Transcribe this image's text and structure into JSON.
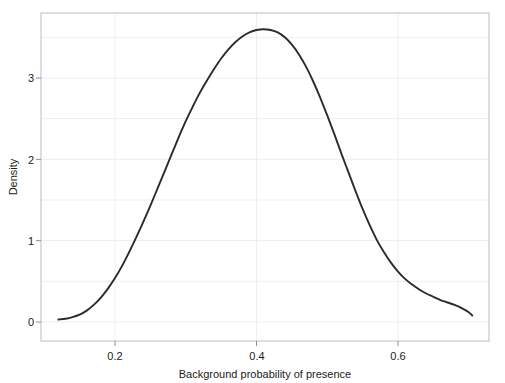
{
  "chart_data": {
    "type": "line",
    "title": "",
    "subtitle": "",
    "xlabel": "Background probability of presence",
    "ylabel": "Density",
    "xlim": [
      0.105,
      0.755
    ],
    "ylim": [
      -0.07,
      3.75
    ],
    "grid": true,
    "grid_color": "#eceef1",
    "legend": null,
    "legend_position": "none",
    "line_color": "#2b2b2b",
    "line_width": 1.9,
    "background": "#ffffff",
    "frame_color": "#b9bcc0",
    "xticks": [
      0.2,
      0.4,
      0.6
    ],
    "xtick_labels": [
      "0.2",
      "0.4",
      "0.6"
    ],
    "yticks": [
      0,
      1,
      2,
      3
    ],
    "ytick_labels": [
      "0",
      "1",
      "2",
      "3"
    ],
    "series": [
      {
        "name": "Density",
        "x": [
          0.12,
          0.13,
          0.14,
          0.15,
          0.16,
          0.17,
          0.18,
          0.19,
          0.2,
          0.21,
          0.22,
          0.23,
          0.24,
          0.25,
          0.26,
          0.27,
          0.28,
          0.29,
          0.3,
          0.31,
          0.32,
          0.33,
          0.34,
          0.35,
          0.36,
          0.37,
          0.38,
          0.39,
          0.4,
          0.41,
          0.42,
          0.43,
          0.44,
          0.45,
          0.46,
          0.47,
          0.48,
          0.49,
          0.5,
          0.51,
          0.52,
          0.53,
          0.54,
          0.55,
          0.56,
          0.57,
          0.58,
          0.59,
          0.6,
          0.61,
          0.62,
          0.63,
          0.64,
          0.65,
          0.66,
          0.67,
          0.68,
          0.69,
          0.7,
          0.705
        ],
        "y": [
          0.03,
          0.04,
          0.06,
          0.09,
          0.14,
          0.21,
          0.3,
          0.41,
          0.54,
          0.69,
          0.86,
          1.04,
          1.23,
          1.43,
          1.64,
          1.85,
          2.06,
          2.27,
          2.47,
          2.65,
          2.82,
          2.97,
          3.11,
          3.24,
          3.35,
          3.44,
          3.51,
          3.56,
          3.59,
          3.6,
          3.59,
          3.56,
          3.5,
          3.41,
          3.29,
          3.14,
          2.96,
          2.76,
          2.54,
          2.31,
          2.07,
          1.84,
          1.61,
          1.39,
          1.19,
          1.01,
          0.86,
          0.73,
          0.62,
          0.53,
          0.46,
          0.4,
          0.35,
          0.31,
          0.27,
          0.24,
          0.21,
          0.17,
          0.12,
          0.08
        ]
      }
    ],
    "peak": {
      "x": 0.412,
      "y": 3.6
    }
  },
  "axes": {
    "x_title": "Background probability of presence",
    "y_title": "Density",
    "x_tick_0": "0.2",
    "x_tick_1": "0.4",
    "x_tick_2": "0.6",
    "y_tick_0": "0",
    "y_tick_1": "1",
    "y_tick_2": "2",
    "y_tick_3": "3"
  }
}
